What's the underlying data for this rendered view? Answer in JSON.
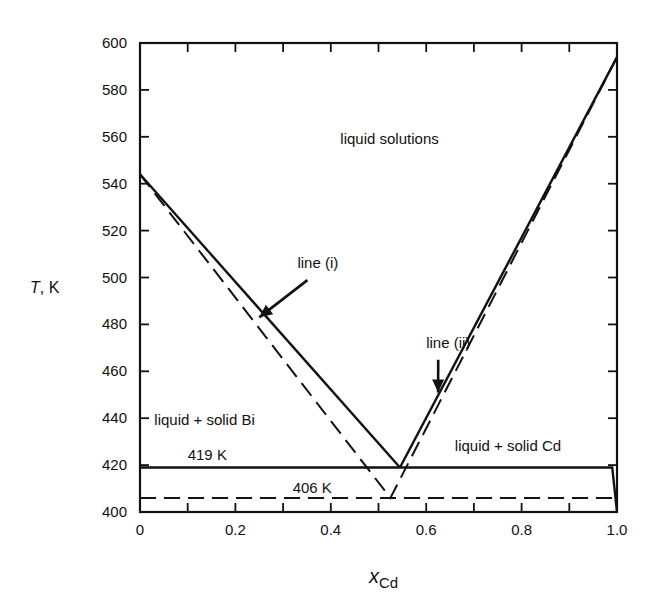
{
  "chart_data": {
    "type": "line",
    "title": "",
    "xlabel": "x_Cd",
    "xlabel_main": "x",
    "xlabel_sub": "Cd",
    "ylabel": "T, K",
    "ylabel_italic": "T",
    "ylabel_unit": ", K",
    "xlim": [
      0,
      1.0
    ],
    "ylim": [
      400,
      600
    ],
    "x_ticks": [
      0,
      0.2,
      0.4,
      0.6,
      0.8,
      1.0
    ],
    "x_tick_labels": [
      "0",
      "0.2",
      "0.4",
      "0.6",
      "0.8",
      "1.0"
    ],
    "x_minor_ticks": [
      0.1,
      0.3,
      0.5,
      0.7,
      0.9
    ],
    "y_ticks": [
      400,
      420,
      440,
      460,
      480,
      500,
      520,
      540,
      560,
      580,
      600
    ],
    "y_tick_labels": [
      "400",
      "420",
      "440",
      "460",
      "480",
      "500",
      "520",
      "540",
      "560",
      "580",
      "600"
    ],
    "grid": false,
    "legend": null,
    "series": [
      {
        "name": "line (i)",
        "style": "solid",
        "x": [
          0,
          0.545
        ],
        "y": [
          544,
          419
        ]
      },
      {
        "name": "line (ii)",
        "style": "solid",
        "x": [
          0.545,
          1.0
        ],
        "y": [
          419,
          594
        ]
      },
      {
        "name": "ideal liquidus (dashed)",
        "style": "dashed",
        "x": [
          0,
          0.525,
          1.0
        ],
        "y": [
          544,
          406,
          594
        ]
      },
      {
        "name": "eutectic 419 K",
        "style": "solid",
        "x": [
          0,
          0.99,
          1.0
        ],
        "y": [
          419,
          419,
          400
        ]
      },
      {
        "name": "eutectic 406 K",
        "style": "dashed",
        "x": [
          0,
          1.0
        ],
        "y": [
          406,
          406
        ]
      }
    ],
    "annotations": [
      {
        "text": "liquid solutions",
        "x": 0.42,
        "y": 557
      },
      {
        "text": "line (i)",
        "x": 0.33,
        "y": 504,
        "arrow_to": [
          0.25,
          483
        ]
      },
      {
        "text": "line (ii)",
        "x": 0.6,
        "y": 470,
        "arrow_to": [
          0.625,
          451
        ]
      },
      {
        "text": "liquid + solid Bi",
        "x": 0.03,
        "y": 437
      },
      {
        "text": "liquid + solid Cd",
        "x": 0.66,
        "y": 426
      },
      {
        "text": "419 K",
        "x": 0.1,
        "y": 422
      },
      {
        "text": "406 K",
        "x": 0.32,
        "y": 408
      }
    ]
  }
}
